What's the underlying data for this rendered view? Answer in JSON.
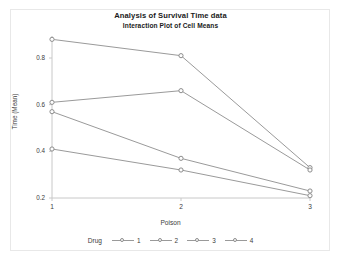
{
  "chart_data": {
    "type": "line",
    "title": "Analysis of Survival Time data",
    "subtitle": "Interaction Plot of Cell Means",
    "xlabel": "Poison",
    "ylabel": "Time (Mean)",
    "categories": [
      "1",
      "2",
      "3"
    ],
    "x": [
      1,
      2,
      3
    ],
    "xlim": [
      1,
      3
    ],
    "ylim": [
      0.18,
      0.9
    ],
    "yticks": [
      0.2,
      0.4,
      0.6,
      0.8
    ],
    "ytick_labels": [
      "0.2",
      "0.4",
      "0.6",
      "0.8"
    ],
    "xticks": [
      1,
      2,
      3
    ],
    "xtick_labels": [
      "1",
      "2",
      "3"
    ],
    "grid": false,
    "legend_position": "bottom",
    "legend_title": "Drug",
    "marker": "circle-open",
    "line_color": "#9a9a9a",
    "marker_edge_color": "#8d8d8d",
    "axis_color": "#c8c8c8",
    "text_color": "#3c3c3c",
    "background": "#ffffff",
    "series": [
      {
        "name": "1",
        "values": [
          0.88,
          0.81,
          0.33
        ]
      },
      {
        "name": "2",
        "values": [
          0.61,
          0.66,
          0.32
        ]
      },
      {
        "name": "3",
        "values": [
          0.57,
          0.37,
          0.23
        ]
      },
      {
        "name": "4",
        "values": [
          0.41,
          0.32,
          0.21
        ]
      }
    ]
  },
  "legend": {
    "title": "Drug",
    "entries": [
      {
        "label": "1"
      },
      {
        "label": "2"
      },
      {
        "label": "3"
      },
      {
        "label": "4"
      }
    ]
  }
}
